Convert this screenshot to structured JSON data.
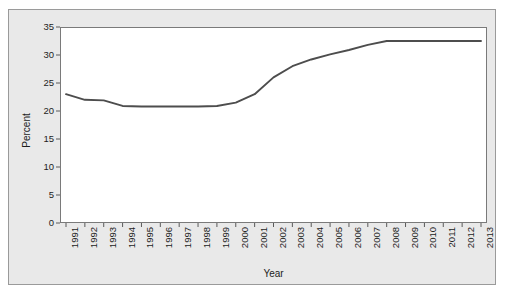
{
  "chart_data": {
    "type": "line",
    "title": "",
    "xlabel": "Year",
    "ylabel": "Percent",
    "grid": false,
    "legend": null,
    "xlim": [
      1990.5,
      2013.5
    ],
    "ylim": [
      0,
      35
    ],
    "ytick_labels": [
      "0",
      "5",
      "10",
      "15",
      "20",
      "25",
      "30",
      "35"
    ],
    "ytick_values": [
      0,
      5,
      10,
      15,
      20,
      25,
      30,
      35
    ],
    "categories": [
      "1991",
      "1992",
      "1993",
      "1994",
      "1995",
      "1996",
      "1997",
      "1998",
      "1999",
      "2000",
      "2001",
      "2002",
      "2003",
      "2004",
      "2005",
      "2006",
      "2007",
      "2008",
      "2009",
      "2010",
      "2011",
      "2012",
      "2013"
    ],
    "x": [
      1991,
      1992,
      1993,
      1994,
      1995,
      1996,
      1997,
      1998,
      1999,
      2000,
      2001,
      2002,
      2003,
      2004,
      2005,
      2006,
      2007,
      2008,
      2009,
      2010,
      2011,
      2012,
      2013
    ],
    "values": [
      23.0,
      22.0,
      21.9,
      20.9,
      20.8,
      20.8,
      20.8,
      20.8,
      20.9,
      21.5,
      23.0,
      26.0,
      28.0,
      29.2,
      30.1,
      30.9,
      31.8,
      32.5,
      32.5,
      32.5,
      32.5,
      32.5,
      32.5
    ],
    "series": [
      {
        "name": "Percent",
        "color": "#4d4d4d",
        "values": [
          23.0,
          22.0,
          21.9,
          20.9,
          20.8,
          20.8,
          20.8,
          20.8,
          20.9,
          21.5,
          23.0,
          26.0,
          28.0,
          29.2,
          30.1,
          30.9,
          31.8,
          32.5,
          32.5,
          32.5,
          32.5,
          32.5,
          32.5
        ]
      }
    ]
  },
  "colors": {
    "line": "#4d4d4d",
    "panel_background": "#e9e9e9",
    "plot_background": "#ffffff",
    "axis": "#5a5a5a",
    "text": "#1d1d1d"
  }
}
